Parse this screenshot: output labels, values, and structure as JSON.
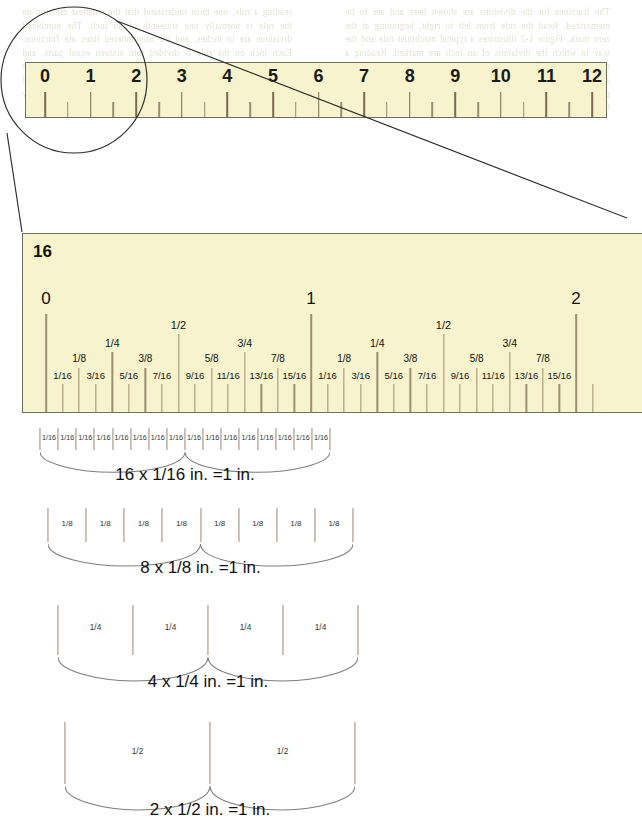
{
  "figure": {
    "title_hidden": "Ruler fraction subdivisions",
    "small_ruler": {
      "name": "twelve-inch-ruler",
      "labels": [
        "0",
        "1",
        "2",
        "3",
        "4",
        "5",
        "6",
        "7",
        "8",
        "9",
        "10",
        "11",
        "12"
      ],
      "fill_color": "#f7f3cd",
      "border_color": "#6e6e5e",
      "tick_color": "#8a7b63",
      "inches": 12
    },
    "big_ruler": {
      "name": "enlarged-two-inch-ruler",
      "corner_label": "16",
      "inch_labels": [
        "0",
        "1",
        "2"
      ],
      "fill_color": "#f7f3cd",
      "border_color": "#6e6e5e",
      "sixteenths_labels": [
        "1/16",
        "3/16",
        "5/16",
        "7/16",
        "9/16",
        "11/16",
        "13/16",
        "15/16"
      ],
      "eighths_labels": [
        "1/8",
        "3/8",
        "5/8",
        "7/8"
      ],
      "quarter_labels": [
        "1/4",
        "3/4"
      ],
      "half_label": "1/2"
    },
    "brace_rows": [
      {
        "name": "sixteenths-row",
        "segment_label": "1/16",
        "segment_count": 16,
        "caption": "16 x 1/16 in. =1 in."
      },
      {
        "name": "eighths-row",
        "segment_label": "1/8",
        "segment_count": 8,
        "caption": "8 x 1/8 in. =1 in."
      },
      {
        "name": "quarters-row",
        "segment_label": "1/4",
        "segment_count": 4,
        "caption": "4 x 1/4 in. =1 in."
      },
      {
        "name": "halves-row",
        "segment_label": "1/2",
        "segment_count": 2,
        "caption": "2 x 1/2 in. =1 in."
      }
    ],
    "callout": {
      "name": "magnifier-callout",
      "shape": "circle-with-leader-lines",
      "stroke_color": "#2b2b2b"
    }
  },
  "background_text": {
    "left_column": "reading a rule, one must understand that the smallest division on the rule is normally one sixteenth of an inch. The numbered divisions are in inches, and the unnumbered lines are fractions. Each inch on the rule is divided into sixteen equal parts, and each of these parts is one sixteenth of an inch. To read a rule accurately one must be able to recognize quickly the value of each of these lines so that measurements may be made rapidly and correctly at all times.",
    "right_column": "The fractions for the divisions are shown here and are to be memorized. Read the rule from left to right, beginning at the zero mark. Figure 1-2 illustrates a typical machinist rule and the way in which the divisions of an inch are marked. Reading a rule is not as difficult as it seems once the principles behind it are understood. The denominator indicates the number of equal parts into which the inch has been divided, while the numerator tells how many of those parts are being measured."
  }
}
